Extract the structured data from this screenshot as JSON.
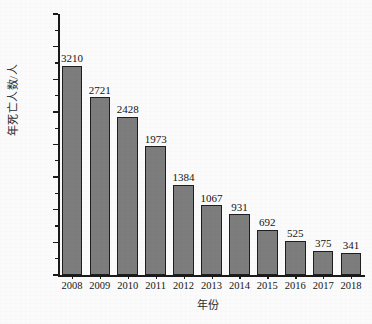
{
  "chart_data": {
    "type": "bar",
    "title": "",
    "xlabel": "年份",
    "ylabel": "年死亡人数/人",
    "categories": [
      "2008",
      "2009",
      "2010",
      "2011",
      "2012",
      "2013",
      "2014",
      "2015",
      "2016",
      "2017",
      "2018"
    ],
    "values": [
      3210,
      2721,
      2428,
      1973,
      1384,
      1067,
      931,
      692,
      525,
      375,
      341
    ],
    "value_labels": [
      "3210",
      "2721",
      "2428",
      "1973",
      "1384",
      "1067",
      "931",
      "692",
      "525",
      "375",
      "341"
    ],
    "ylim": [
      0,
      4000
    ],
    "ytick_labels": [
      "0",
      "500",
      "1000",
      "1500",
      "2000",
      "2500",
      "3000",
      "3500",
      "4000"
    ],
    "ytick_values": [
      0,
      500,
      1000,
      1500,
      2000,
      2500,
      3000,
      3500,
      4000
    ],
    "yminor_values": [
      250,
      750,
      1250,
      1750,
      2250,
      2750,
      3250,
      3750
    ],
    "grid": false,
    "legend": false,
    "legend_position": "none",
    "bar_color": "#7d7d7d",
    "bar_edge_color": "#1e1e1e",
    "axis_color": "#1a1a1a",
    "background_color": "#fbfbfb",
    "text_color": "#161616"
  }
}
